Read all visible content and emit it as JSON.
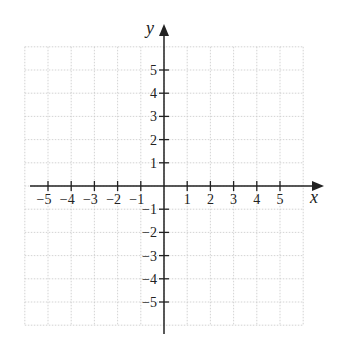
{
  "chart_data": {
    "type": "scatter",
    "title": "",
    "xlabel": "x",
    "ylabel": "y",
    "xlim": [
      -6,
      6
    ],
    "ylim": [
      -6,
      6
    ],
    "grid": true,
    "x_ticks": [
      -5,
      -4,
      -3,
      -2,
      -1,
      1,
      2,
      3,
      4,
      5
    ],
    "y_ticks": [
      5,
      4,
      3,
      2,
      1,
      -1,
      -2,
      -3,
      -4,
      -5
    ],
    "x_tick_labels": [
      "−5",
      "−4",
      "−3",
      "−2",
      "−1",
      "1",
      "2",
      "3",
      "4",
      "5"
    ],
    "y_tick_labels": [
      "5",
      "4",
      "3",
      "2",
      "1",
      "−1",
      "−2",
      "−3",
      "−4",
      "−5"
    ],
    "series": []
  },
  "colors": {
    "axis": "#222222",
    "grid": "#c8c8c8"
  }
}
